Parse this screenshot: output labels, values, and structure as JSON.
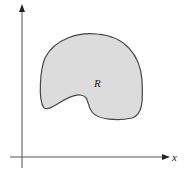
{
  "diagram": {
    "region_label": "R",
    "x_axis_label": "x",
    "y_axis_label": "y",
    "colors": {
      "region_fill": "#dcdcdc",
      "region_stroke": "#444444",
      "axis": "#555555"
    }
  }
}
